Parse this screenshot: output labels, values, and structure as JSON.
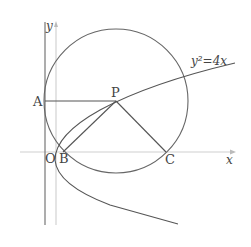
{
  "diagram": {
    "equation_label": "y²=4x",
    "axis_labels": {
      "x": "x",
      "y": "y"
    },
    "points": {
      "A": "A",
      "P": "P",
      "O": "O",
      "B": "B",
      "C": "C"
    },
    "colors": {
      "curve": "#555555",
      "axis_light": "#cccccc",
      "axis_dark": "#777777",
      "text": "#444444"
    }
  }
}
